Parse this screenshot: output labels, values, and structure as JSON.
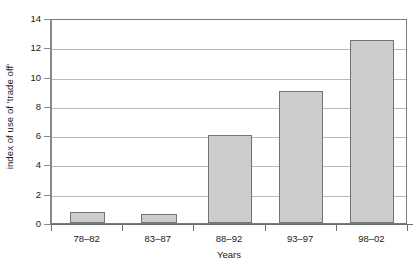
{
  "chart_data": {
    "type": "bar",
    "title": "",
    "xlabel": "Years",
    "ylabel": "index of use of 'trade off'",
    "categories": [
      "78–82",
      "83–87",
      "88–92",
      "93–97",
      "98–02"
    ],
    "values": [
      0.75,
      0.6,
      6.0,
      9.0,
      12.5
    ],
    "ylim": [
      0,
      14
    ],
    "yticks": [
      0,
      2,
      4,
      6,
      8,
      10,
      12,
      14
    ],
    "ytick_labels": [
      "0",
      "2",
      "4",
      "6",
      "8",
      "10",
      "12",
      "14"
    ],
    "grid": "horizontal",
    "legend": "none",
    "series": [
      {
        "name": "index of use of 'trade off'",
        "values": [
          0.75,
          0.6,
          6.0,
          9.0,
          12.5
        ],
        "color": "#cccccc",
        "edge_color": "#737373"
      }
    ]
  },
  "colors": {
    "bar_fill": "#cccccc",
    "bar_edge": "#737373",
    "gridline": "#b9b9b9",
    "axis": "#7a7a7a",
    "text": "#1a1a1a",
    "background": "#ffffff"
  }
}
